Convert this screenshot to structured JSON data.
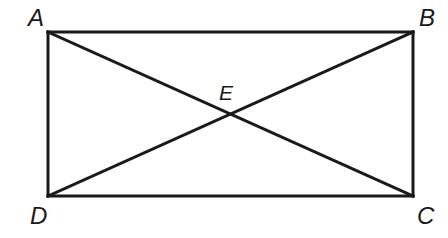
{
  "figure": {
    "shape_type": "rectangle-with-diagonals",
    "background_color": "#ffffff",
    "stroke_color": "#1a1a1a",
    "stroke_width": 3,
    "diagonal_stroke_width": 3
  },
  "labels": {
    "a": "A",
    "b": "B",
    "c": "C",
    "d": "D",
    "e": "E"
  },
  "geometry": {
    "rectangle": {
      "left": 48,
      "top": 32,
      "right": 413,
      "bottom": 196,
      "width": 365,
      "height": 164
    },
    "vertices": {
      "a": {
        "x": 48,
        "y": 32,
        "label_position": "above-left"
      },
      "b": {
        "x": 413,
        "y": 32,
        "label_position": "above-right"
      },
      "c": {
        "x": 413,
        "y": 196,
        "label_position": "below-right"
      },
      "d": {
        "x": 48,
        "y": 196,
        "label_position": "below-left"
      },
      "e": {
        "x": 230,
        "y": 114,
        "label_position": "above"
      }
    },
    "edges": [
      {
        "name": "AB",
        "from": "a",
        "to": "b"
      },
      {
        "name": "BC",
        "from": "b",
        "to": "c"
      },
      {
        "name": "CD",
        "from": "c",
        "to": "d"
      },
      {
        "name": "DA",
        "from": "d",
        "to": "a"
      }
    ],
    "diagonals": [
      {
        "name": "AC",
        "from": "a",
        "to": "c"
      },
      {
        "name": "DB",
        "from": "d",
        "to": "b"
      }
    ]
  }
}
